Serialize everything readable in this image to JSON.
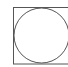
{
  "diagram": {
    "shapes": [
      {
        "type": "square",
        "name": "outer-square",
        "stroke": "#555555"
      },
      {
        "type": "circle",
        "name": "inscribed-circle",
        "stroke": "#555555"
      }
    ],
    "background": "#ffffff"
  }
}
